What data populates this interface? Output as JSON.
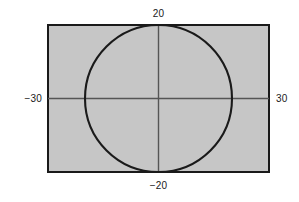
{
  "figure": {
    "title": "",
    "background_color": "#ffffff"
  },
  "chart_data": {
    "type": "area",
    "title": "",
    "subtitle": "",
    "xlabel": "",
    "ylabel": "",
    "xlim": [
      -30,
      30
    ],
    "ylim": [
      -20,
      20
    ],
    "grid": false,
    "legend": null,
    "legend_position": "none",
    "tick_labels": {
      "top": "20",
      "bottom": "−20",
      "left": "−30",
      "right": "30"
    },
    "annotations": [
      {
        "name": "top-label",
        "text": "20",
        "value": 20,
        "axis": "y",
        "position": "above-rectangle"
      },
      {
        "name": "bottom-label",
        "text": "−20",
        "value": -20,
        "axis": "y",
        "position": "below-rectangle"
      },
      {
        "name": "left-label",
        "text": "−30",
        "value": -30,
        "axis": "x",
        "position": "left-of-rectangle"
      },
      {
        "name": "right-label",
        "text": "30",
        "value": 30,
        "axis": "x",
        "position": "right-of-rectangle"
      }
    ],
    "shapes": [
      {
        "name": "shaded-rectangle",
        "type": "rectangle",
        "x_range": [
          -30,
          30
        ],
        "y_range": [
          -20,
          20
        ],
        "width": 60,
        "height": 40,
        "fill": "#c6c6c6",
        "stroke": "#1a1a1a",
        "stroke_width": 2
      },
      {
        "name": "circle",
        "type": "circle",
        "center": [
          0,
          0
        ],
        "radius": 20,
        "fill": "none",
        "stroke": "#1a1a1a",
        "stroke_width": 2
      },
      {
        "name": "horizontal-axis",
        "type": "line",
        "from": [
          -30,
          0
        ],
        "to": [
          30,
          0
        ],
        "stroke": "#555555",
        "stroke_width": 1
      },
      {
        "name": "vertical-axis",
        "type": "line",
        "from": [
          0,
          -20
        ],
        "to": [
          0,
          20
        ],
        "stroke": "#555555",
        "stroke_width": 1
      }
    ],
    "colors": {
      "region_fill": "#c6c6c6",
      "outline": "#1a1a1a",
      "axis": "#555555",
      "text": "#1a1a1a",
      "background": "#ffffff"
    }
  }
}
